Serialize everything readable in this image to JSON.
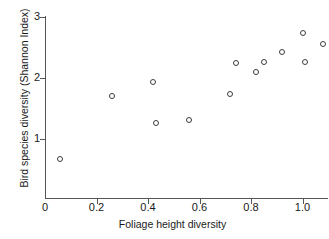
{
  "chart_data": {
    "type": "scatter",
    "title": "",
    "xlabel": "Foliage height diversity",
    "ylabel": "Bird species diversity (Shannon Index)",
    "xlim": [
      0.0,
      1.12
    ],
    "ylim": [
      0.0,
      3.05
    ],
    "xticks": [
      "0",
      "0.2",
      "0.4",
      "0.6",
      "0.8",
      "1.0"
    ],
    "xtick_values": [
      0.0,
      0.2,
      0.4,
      0.6,
      0.8,
      1.0
    ],
    "yticks": [
      "1",
      "2",
      "3"
    ],
    "ytick_values": [
      1,
      2,
      3
    ],
    "grid": false,
    "legend": null,
    "marker": "open-circle",
    "marker_color": "#3d3d3d",
    "x": [
      0.06,
      0.26,
      0.42,
      0.43,
      0.56,
      0.72,
      0.74,
      0.82,
      0.85,
      0.92,
      1.0,
      1.01,
      1.08
    ],
    "y": [
      0.67,
      1.7,
      1.93,
      1.26,
      1.31,
      1.73,
      2.24,
      2.1,
      2.27,
      2.42,
      2.74,
      2.27,
      2.56
    ],
    "points": [
      {
        "x": 0.06,
        "y": 0.67
      },
      {
        "x": 0.26,
        "y": 1.7
      },
      {
        "x": 0.42,
        "y": 1.93
      },
      {
        "x": 0.43,
        "y": 1.26
      },
      {
        "x": 0.56,
        "y": 1.31
      },
      {
        "x": 0.72,
        "y": 1.73
      },
      {
        "x": 0.74,
        "y": 2.24
      },
      {
        "x": 0.82,
        "y": 2.1
      },
      {
        "x": 0.85,
        "y": 2.27
      },
      {
        "x": 0.92,
        "y": 2.42
      },
      {
        "x": 1.0,
        "y": 2.74
      },
      {
        "x": 1.01,
        "y": 2.27
      },
      {
        "x": 1.08,
        "y": 2.56
      }
    ]
  }
}
